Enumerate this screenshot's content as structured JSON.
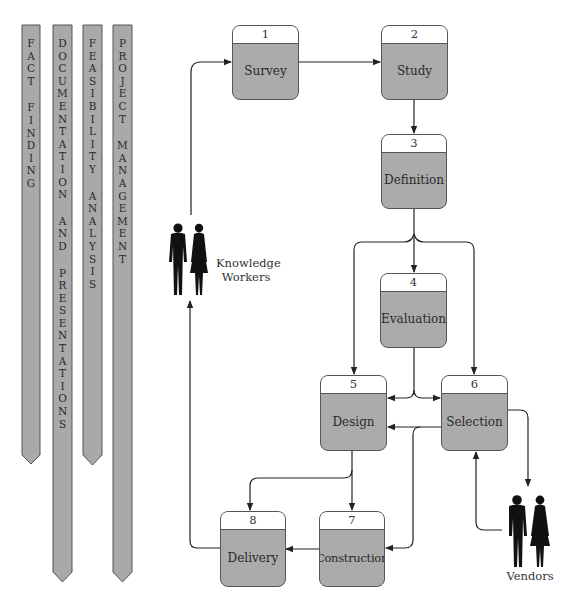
{
  "activities": [
    {
      "id": "fact-finding",
      "letters": [
        "F",
        "A",
        "C",
        "T",
        "",
        "F",
        "I",
        "N",
        "D",
        "I",
        "N",
        "G"
      ]
    },
    {
      "id": "documentation-and-presentations",
      "letters": [
        "D",
        "O",
        "C",
        "U",
        "M",
        "E",
        "N",
        "T",
        "A",
        "T",
        "I",
        "O",
        "N",
        "",
        "A",
        "N",
        "D",
        "",
        "P",
        "R",
        "E",
        "S",
        "E",
        "N",
        "T",
        "A",
        "T",
        "I",
        "O",
        "N",
        "S"
      ]
    },
    {
      "id": "feasibility-analysis",
      "letters": [
        "F",
        "E",
        "A",
        "S",
        "I",
        "B",
        "I",
        "L",
        "I",
        "T",
        "Y",
        "",
        "A",
        "N",
        "A",
        "L",
        "Y",
        "S",
        "I",
        "S"
      ]
    },
    {
      "id": "project-management",
      "letters": [
        "P",
        "R",
        "O",
        "J",
        "E",
        "C",
        "T",
        "",
        "M",
        "A",
        "N",
        "A",
        "G",
        "E",
        "M",
        "E",
        "N",
        "T"
      ]
    }
  ],
  "activity_labels": [
    "Fact Finding",
    "Documentation and Presentations",
    "Feasibility Analysis",
    "Project Management"
  ],
  "phases": [
    {
      "number": "1",
      "label": "Survey"
    },
    {
      "number": "2",
      "label": "Study"
    },
    {
      "number": "3",
      "label": "Definition"
    },
    {
      "number": "4",
      "label": "Evaluation"
    },
    {
      "number": "5",
      "label": "Design"
    },
    {
      "number": "6",
      "label": "Selection"
    },
    {
      "number": "7",
      "label": "Construction"
    },
    {
      "number": "8",
      "label": "Delivery"
    }
  ],
  "actors": {
    "knowledge_workers": {
      "line1": "Knowledge",
      "line2": "Workers"
    },
    "vendors": {
      "label": "Vendors"
    }
  },
  "colors": {
    "box_fill": "#ababab",
    "column_fill": "#a9a9a9",
    "line": "#222222"
  }
}
